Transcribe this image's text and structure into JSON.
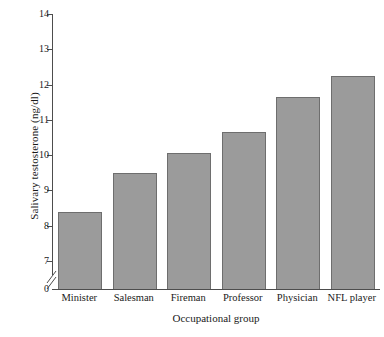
{
  "chart_data": {
    "type": "bar",
    "title": "",
    "xlabel": "Occupational group",
    "ylabel": "Salivary testosterone (ng/dl)",
    "categories": [
      "Minister",
      "Salesman",
      "Fireman",
      "Professor",
      "Physician",
      "NFL player"
    ],
    "values": [
      8.4,
      9.5,
      10.05,
      10.65,
      11.65,
      12.25
    ],
    "ylim": [
      6.6,
      14
    ],
    "yticks": [
      7,
      8,
      9,
      10,
      11,
      12,
      13,
      14
    ],
    "ytick_labels": [
      "7",
      "8",
      "9",
      "10",
      "11",
      "12",
      "13",
      "14"
    ],
    "origin_label": "0",
    "axis_break": true,
    "grid": false,
    "legend": null,
    "bar_color": "#9b9b9b",
    "bar_border_color": "#6e6e6e",
    "axis_color": "#4d4d4d"
  }
}
